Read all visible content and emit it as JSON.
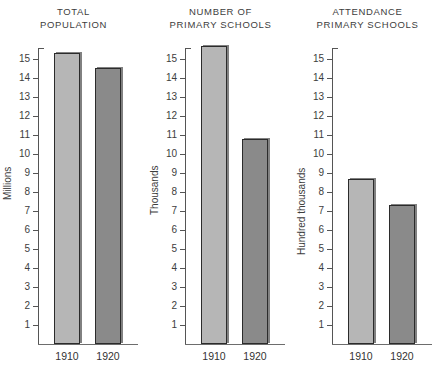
{
  "chart_data": [
    {
      "type": "bar",
      "title": "TOTAL POPULATION",
      "title_lines": [
        "TOTAL",
        "POPULATION"
      ],
      "ylabel": "Millions",
      "xlabel": "",
      "categories": [
        "1910",
        "1920"
      ],
      "values": [
        15.3,
        14.5
      ],
      "ylim": [
        0,
        16
      ],
      "yticks": [
        1,
        2,
        3,
        4,
        5,
        6,
        7,
        8,
        9,
        10,
        11,
        12,
        13,
        14,
        15
      ],
      "grid": false,
      "legend": "none",
      "colors": [
        "#b6b6b6",
        "#8a8a8a"
      ]
    },
    {
      "type": "bar",
      "title": "NUMBER OF PRIMARY SCHOOLS",
      "title_lines": [
        "NUMBER OF",
        "PRIMARY SCHOOLS"
      ],
      "ylabel": "Thousands",
      "xlabel": "",
      "categories": [
        "1910",
        "1920"
      ],
      "values": [
        15.7,
        10.8
      ],
      "ylim": [
        0,
        16
      ],
      "yticks": [
        1,
        2,
        3,
        4,
        5,
        6,
        7,
        8,
        9,
        10,
        11,
        12,
        13,
        14,
        15
      ],
      "grid": false,
      "legend": "none",
      "colors": [
        "#b6b6b6",
        "#8a8a8a"
      ]
    },
    {
      "type": "bar",
      "title": "ATTENDANCE PRIMARY SCHOOLS",
      "title_lines": [
        "ATTENDANCE",
        "PRIMARY SCHOOLS"
      ],
      "ylabel": "Hundred thousands",
      "xlabel": "",
      "categories": [
        "1910",
        "1920"
      ],
      "values": [
        8.7,
        7.3
      ],
      "ylim": [
        0,
        16
      ],
      "yticks": [
        1,
        2,
        3,
        4,
        5,
        6,
        7,
        8,
        9,
        10,
        11,
        12,
        13,
        14,
        15
      ],
      "grid": false,
      "legend": "none",
      "colors": [
        "#b6b6b6",
        "#8a8a8a"
      ]
    }
  ]
}
